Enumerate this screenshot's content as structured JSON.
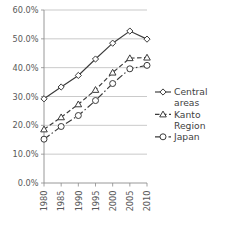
{
  "chart_data": {
    "type": "line",
    "title": "",
    "subtitle": "",
    "xlabel": "",
    "ylabel": "",
    "categories": [
      "1980",
      "1985",
      "1990",
      "1995",
      "2000",
      "2005",
      "2010"
    ],
    "x": [
      1980,
      1985,
      1990,
      1995,
      2000,
      2005,
      2010
    ],
    "ylim": [
      0,
      60
    ],
    "ytick_values": [
      0,
      10,
      20,
      30,
      40,
      50,
      60
    ],
    "ytick_labels": [
      "0.0%",
      "10.0%",
      "20.0%",
      "30.0%",
      "40.0%",
      "50.0%",
      "60.0%"
    ],
    "grid": "horizontal",
    "legend_position": "right",
    "series": [
      {
        "name": "Central areas",
        "marker": "diamond",
        "linestyle": "solid",
        "color": "#3b3b3b",
        "values": [
          29.2,
          33.3,
          37.3,
          43.0,
          48.5,
          52.7,
          49.9
        ]
      },
      {
        "name": "Kanto Region",
        "marker": "triangle",
        "linestyle": "dashed",
        "color": "#3b3b3b",
        "values": [
          18.6,
          22.8,
          27.3,
          32.3,
          38.3,
          43.3,
          43.5
        ]
      },
      {
        "name": "Japan",
        "marker": "circle",
        "linestyle": "dash-dot",
        "color": "#3b3b3b",
        "values": [
          15.2,
          19.6,
          23.4,
          28.6,
          34.5,
          39.6,
          40.8
        ]
      }
    ]
  },
  "axes": {
    "y_labels": [
      "60.0%",
      "50.0%",
      "40.0%",
      "30.0%",
      "20.0%",
      "10.0%",
      "0.0%"
    ],
    "x_labels": [
      "1980",
      "1985",
      "1990",
      "1995",
      "2000",
      "2005",
      "2010"
    ]
  },
  "legend": {
    "entries": [
      {
        "label_line1": "Central",
        "label_line2": "areas",
        "icon": "diamond-marker-icon"
      },
      {
        "label_line1": "Kanto",
        "label_line2": "Region",
        "icon": "triangle-marker-icon"
      },
      {
        "label_line1": "Japan",
        "label_line2": "",
        "icon": "circle-marker-icon"
      }
    ]
  }
}
